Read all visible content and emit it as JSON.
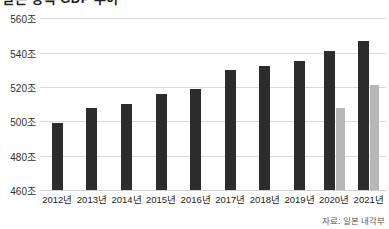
{
  "title": {
    "text": "일본 명목 GDP 추이",
    "visible_partial": true
  },
  "source": {
    "label": "자료: 일본 내각부"
  },
  "colors": {
    "bar_dark": "#2c2c2c",
    "bar_light": "#b7b7b7",
    "gridline": "#d9d9d9",
    "background": "#ffffff",
    "text": "#222222"
  },
  "axis": {
    "y_ticks": [
      "560조",
      "540조",
      "520조",
      "500조",
      "480조",
      "460조"
    ],
    "y_values": [
      560,
      540,
      520,
      500,
      480,
      460
    ],
    "x_ticks": [
      "2012년",
      "2013년",
      "2014년",
      "2015년",
      "2016년",
      "2017년",
      "2018년",
      "2019년",
      "2020년",
      "2021년"
    ]
  },
  "chart_data": {
    "type": "bar",
    "title": "일본 명목 GDP 추이",
    "xlabel": "",
    "ylabel": "",
    "unit": "조",
    "ylim": [
      460,
      566
    ],
    "grid": true,
    "legend_position": "none",
    "categories": [
      "2012년",
      "2013년",
      "2014년",
      "2015년",
      "2016년",
      "2017년",
      "2018년",
      "2019년",
      "2020년",
      "2021년"
    ],
    "series": [
      {
        "name": "명목 GDP",
        "color": "#2c2c2c",
        "values": [
          499,
          508,
          510,
          516,
          519,
          530,
          532,
          535,
          541,
          547
        ]
      },
      {
        "name": "보조 지표",
        "color": "#b7b7b7",
        "values": [
          null,
          null,
          null,
          null,
          null,
          null,
          null,
          null,
          508,
          521
        ]
      }
    ],
    "annotations": [
      "자료: 일본 내각부"
    ]
  }
}
